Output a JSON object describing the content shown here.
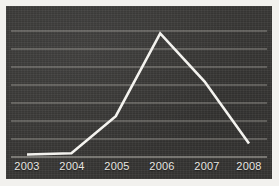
{
  "chart_data": {
    "type": "line",
    "title": "",
    "subtitle": "",
    "xlabel": "",
    "ylabel": "",
    "categories": [
      "2003",
      "2004",
      "2005",
      "2006",
      "2007",
      "2008"
    ],
    "x_tick_labels": [
      "2003",
      "2004",
      "2005",
      "2006",
      "2007",
      "2008"
    ],
    "series": [
      {
        "name": "",
        "values": [
          2,
          3,
          33,
          100,
          61,
          11
        ]
      }
    ],
    "xlim": [
      2002.6,
      2008.4
    ],
    "ylim": [
      0,
      110
    ],
    "y_gridline_values": [
      14,
      28,
      42,
      56,
      70,
      84,
      98
    ],
    "grid": "horizontal",
    "legend": "none",
    "annotations": [],
    "peak_category": "2006",
    "peak_value": 100
  },
  "figure": {
    "panel_background_color": "#3a3937",
    "page_background_color": "#f2f1ee",
    "grid_color": "#b9b7b0",
    "line_color": "#f4f3ef",
    "tick_label_color": "#e8e7e2"
  }
}
